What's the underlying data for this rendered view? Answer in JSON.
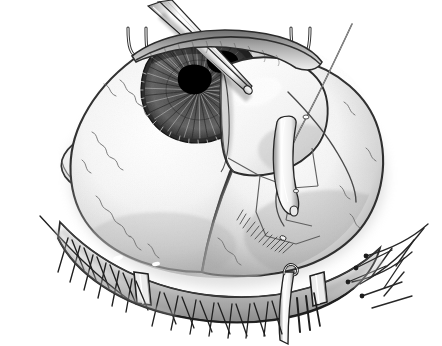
{
  "figure": {
    "title": "Surgical illustration of the human eye during anterior segment surgery",
    "domain": "medical-illustration",
    "technique": "pen-and-ink stipple and hatching, grayscale",
    "canvas": {
      "width": 442,
      "height": 346,
      "background": "#ffffff"
    },
    "alt_text": "Black and white pen and ink medical illustration showing an open human eye held by a lid speculum, with fine forceps entering through a corneal incision, an elevated scleral flap, and a curved suture needle with thread."
  },
  "palette": {
    "background": "#ffffff",
    "ink_black": "#1a1a1a",
    "ink_dark": "#3d3d3d",
    "ink_mid": "#777777",
    "ink_light": "#b4b4b4",
    "ink_faint": "#d8d8d8",
    "sclera_highlight": "#fcfcfc",
    "sclera_shadow": "#cfcfcf",
    "iris_dark": "#4a4a4a",
    "pupil_black": "#000000",
    "instrument_steel": "#f2f2f2",
    "vessel_gray": "#6a6a6a",
    "lash_black": "#222222"
  },
  "anatomy": {
    "parts": [
      {
        "id": "globe",
        "label": "Globe / sclera",
        "region": "center",
        "shade": "light"
      },
      {
        "id": "cornea",
        "label": "Cornea",
        "region": "upper-center",
        "shade": "translucent"
      },
      {
        "id": "limbus",
        "label": "Limbus",
        "region": "corneal margin",
        "shade": "dark-hatched"
      },
      {
        "id": "iris",
        "label": "Iris with radial striations",
        "region": "upper-center",
        "shade": "dark"
      },
      {
        "id": "pupil",
        "label": "Pupil",
        "region": "iris center",
        "shade": "black"
      },
      {
        "id": "caruncle",
        "label": "Medial canthus / caruncle",
        "region": "left",
        "shade": "light"
      },
      {
        "id": "upper-lid",
        "label": "Upper eyelid margin",
        "region": "top",
        "shade": "mid"
      },
      {
        "id": "lower-lid",
        "label": "Lower eyelid margin",
        "region": "bottom",
        "shade": "mid"
      },
      {
        "id": "lashes-lower-left",
        "label": "Lower lashes, medial",
        "region": "bottom-left",
        "shade": "black"
      },
      {
        "id": "lashes-lower-right",
        "label": "Lower lashes, central",
        "region": "bottom-center",
        "shade": "black"
      },
      {
        "id": "lashes-lateral",
        "label": "Lateral canthal lashes",
        "region": "bottom-right",
        "shade": "black"
      },
      {
        "id": "vessels",
        "label": "Conjunctival blood vessels",
        "region": "sclera",
        "shade": "mid"
      }
    ]
  },
  "instruments": {
    "items": [
      {
        "id": "forceps",
        "label": "Fine tying forceps",
        "count": 2,
        "orientation": "entering from upper left, tips at pupil",
        "finish": "polished steel"
      },
      {
        "id": "scleral-flap",
        "label": "Elevated corneoscleral flap",
        "orientation": "reflected to the right over the globe"
      },
      {
        "id": "suture-needle",
        "label": "Curved suture needle",
        "orientation": "vertical, passing through flap edge"
      },
      {
        "id": "suture-thread",
        "label": "Suture thread",
        "orientation": "long strand sweeping to upper right"
      },
      {
        "id": "lid-speculum-upper",
        "label": "Upper lid speculum blade",
        "count": 2,
        "orientation": "two hooked blades at top"
      },
      {
        "id": "lid-retractor-lower-left",
        "label": "Lower lid retractor blade",
        "orientation": "bottom left of lid margin"
      },
      {
        "id": "lid-retractor-lower-right",
        "label": "Lower lid retractor blade",
        "orientation": "bottom right of lid margin"
      },
      {
        "id": "muscle-hook",
        "label": "Muscle hook",
        "orientation": "bottom center, descending below lid margin"
      }
    ]
  }
}
